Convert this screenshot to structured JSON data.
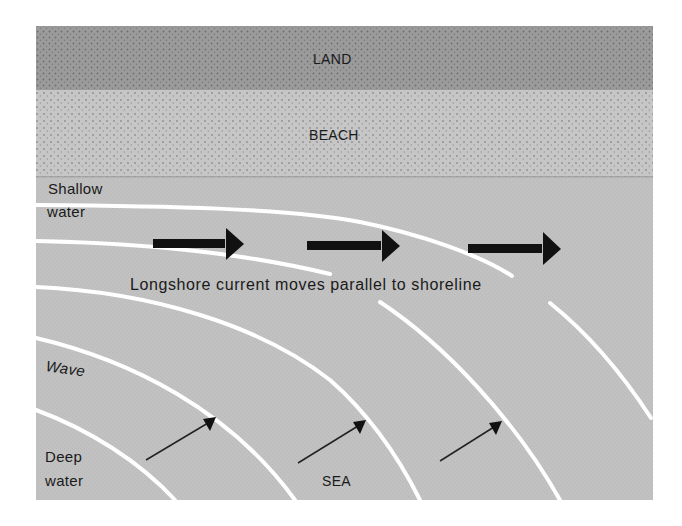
{
  "diagram": {
    "zones": {
      "land": {
        "label": "LAND",
        "color": "#9b9b9b"
      },
      "beach": {
        "label": "BEACH",
        "color": "#c6c6c6"
      },
      "sea": {
        "label": "SEA",
        "color": "#c1c1c1"
      }
    },
    "labels": {
      "shallow_line1": "Shallow",
      "shallow_line2": "water",
      "wave": "Wave",
      "deep_line1": "Deep",
      "deep_line2": "water",
      "current_caption": "Longshore current moves parallel to shoreline"
    },
    "colors": {
      "wave_line": "#ffffff",
      "arrow": "#111111",
      "text": "#1a1a1a"
    },
    "current_arrows": [
      {
        "x1": 153,
        "x2": 243,
        "y": 243
      },
      {
        "x1": 307,
        "x2": 400,
        "y": 245
      },
      {
        "x1": 468,
        "x2": 560,
        "y": 248
      }
    ],
    "wave_direction_arrows": [
      {
        "x1": 146,
        "y1": 460,
        "x2": 216,
        "y2": 418
      },
      {
        "x1": 298,
        "y1": 463,
        "x2": 366,
        "y2": 421
      },
      {
        "x1": 440,
        "y1": 461,
        "x2": 502,
        "y2": 422
      }
    ]
  }
}
